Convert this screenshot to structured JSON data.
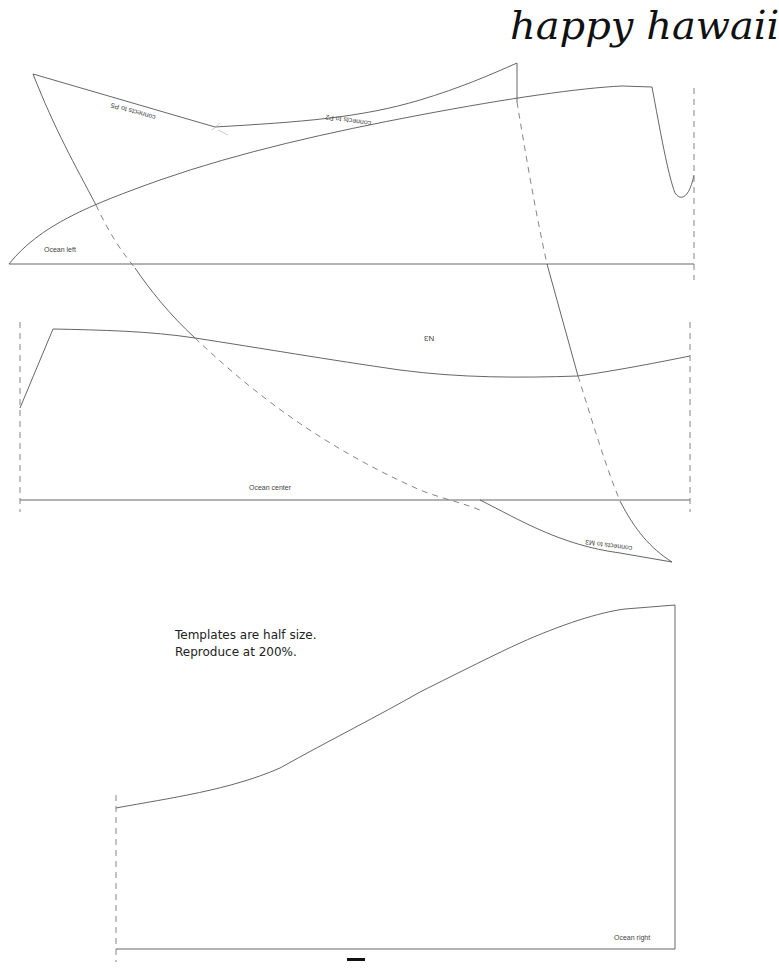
{
  "title": "happy hawaii",
  "pieces": {
    "ocean_left": {
      "label": "Ocean left"
    },
    "ocean_center": {
      "label": "Ocean center"
    },
    "ocean_right": {
      "label": "Ocean right"
    },
    "n3": {
      "label": "N3"
    }
  },
  "edge_labels": {
    "p5": "connects to P5",
    "p2": "connects to P2",
    "m3": "connects to M3"
  },
  "note": {
    "line1": "Templates are half size.",
    "line2": "Reproduce at 200%."
  },
  "colors": {
    "line": "#555555",
    "dash": "#777777",
    "text": "#222222"
  }
}
